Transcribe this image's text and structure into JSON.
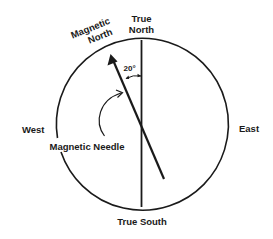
{
  "diagram": {
    "labels": {
      "true_north_line1": "True",
      "true_north_line2": "North",
      "magnetic_north_line1": "Magnetic",
      "magnetic_north_line2": "North",
      "west": "West",
      "east": "East",
      "true_south": "True South",
      "magnetic_needle": "Magnetic Needle",
      "declination": "20°"
    },
    "declination_degrees": 20,
    "declination_direction": "west",
    "colors": {
      "stroke": "#1a1a1a",
      "background": "#ffffff"
    }
  }
}
